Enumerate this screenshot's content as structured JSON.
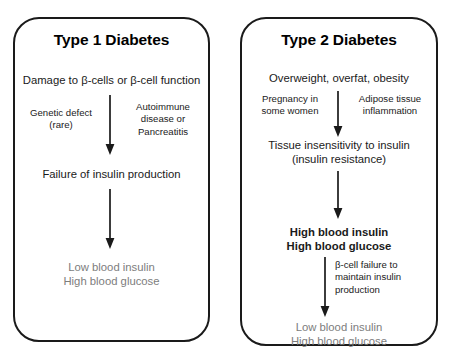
{
  "diagram": {
    "title_visible": false,
    "background_color": "#ffffff",
    "line_color": "#1a1a1a",
    "muted_text_color": "#7d7d7d",
    "panels": [
      {
        "id": "type-1",
        "title": "Type 1 Diabetes",
        "nodes": [
          {
            "id": "t1-cause",
            "lines": [
              "Damage to β-cells or β-cell function"
            ],
            "style": "normal"
          },
          {
            "id": "t1-failure",
            "lines": [
              "Failure of insulin production"
            ],
            "style": "normal"
          },
          {
            "id": "t1-outcome",
            "lines": [
              "Low blood insulin",
              "High blood glucose"
            ],
            "style": "grey"
          }
        ],
        "side_labels": [
          {
            "id": "t1-genetic",
            "lines": [
              "Genetic defect",
              "(rare)"
            ],
            "align": "center"
          },
          {
            "id": "t1-autoimmune",
            "lines": [
              "Autoimmune",
              "disease or",
              "Pancreatitis"
            ],
            "align": "center"
          }
        ],
        "arrows": [
          {
            "id": "t1-arrow-1",
            "from": "t1-cause",
            "to": "t1-failure"
          },
          {
            "id": "t1-arrow-2",
            "from": "t1-failure",
            "to": "t1-outcome"
          }
        ]
      },
      {
        "id": "type-2",
        "title": "Type 2 Diabetes",
        "nodes": [
          {
            "id": "t2-cause",
            "lines": [
              "Overweight, overfat, obesity"
            ],
            "style": "normal"
          },
          {
            "id": "t2-tissue",
            "lines": [
              "Tissue insensitivity to insulin",
              "(insulin resistance)"
            ],
            "style": "normal"
          },
          {
            "id": "t2-high",
            "lines": [
              "High blood insulin",
              "High blood glucose"
            ],
            "style": "bold"
          },
          {
            "id": "t2-outcome",
            "lines": [
              "Low blood insulin",
              "High blood glucose"
            ],
            "style": "grey"
          }
        ],
        "side_labels": [
          {
            "id": "t2-pregnancy",
            "lines": [
              "Pregnancy in",
              "some women"
            ],
            "align": "center"
          },
          {
            "id": "t2-adipose",
            "lines": [
              "Adipose tissue",
              "inflammation"
            ],
            "align": "center"
          },
          {
            "id": "t2-bcell",
            "lines": [
              "β-cell failure to",
              "maintain insulin",
              "production"
            ],
            "align": "left"
          }
        ],
        "arrows": [
          {
            "id": "t2-arrow-1",
            "from": "t2-cause",
            "to": "t2-tissue"
          },
          {
            "id": "t2-arrow-2",
            "from": "t2-tissue",
            "to": "t2-high"
          },
          {
            "id": "t2-arrow-3",
            "from": "t2-high",
            "to": "t2-outcome"
          }
        ]
      }
    ]
  }
}
